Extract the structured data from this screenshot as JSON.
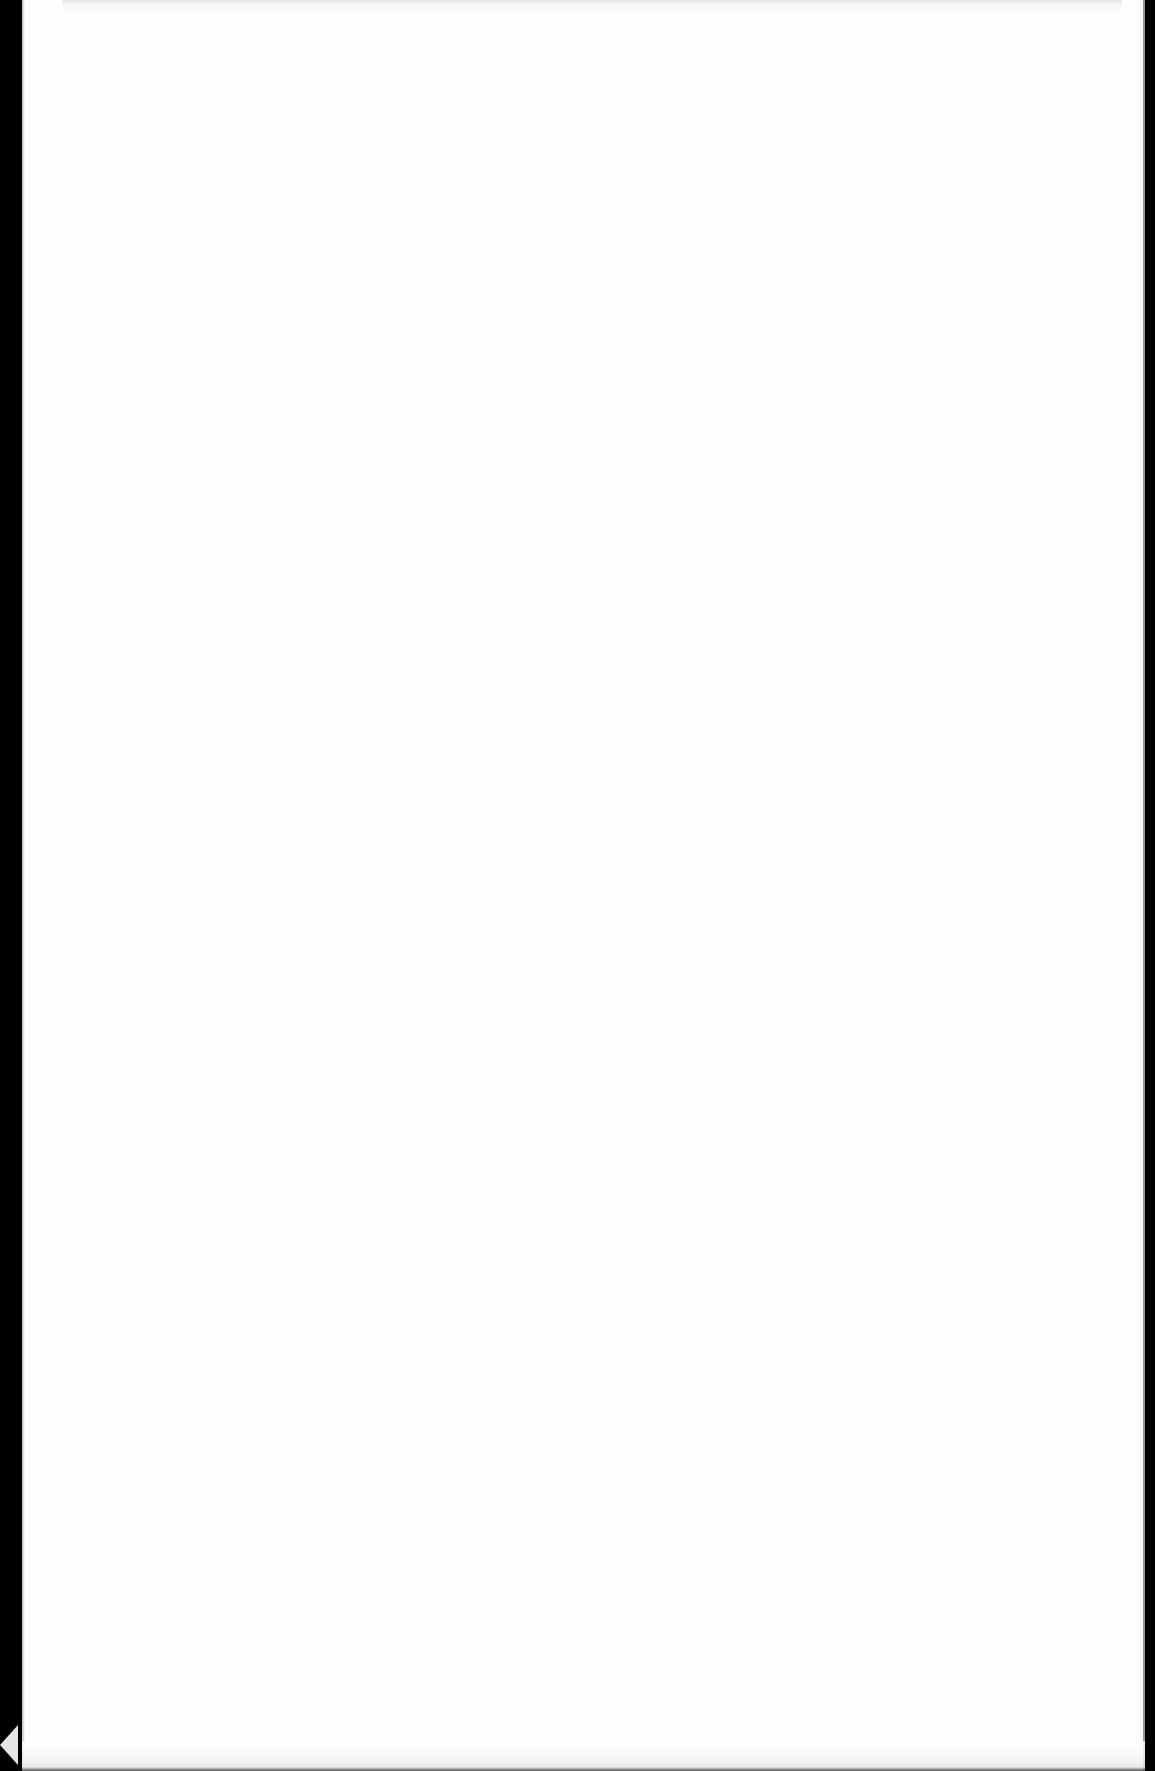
{
  "document": {
    "type": "scanned-page",
    "content": "",
    "page_color": "#fefefe",
    "background_color": "#000000"
  }
}
